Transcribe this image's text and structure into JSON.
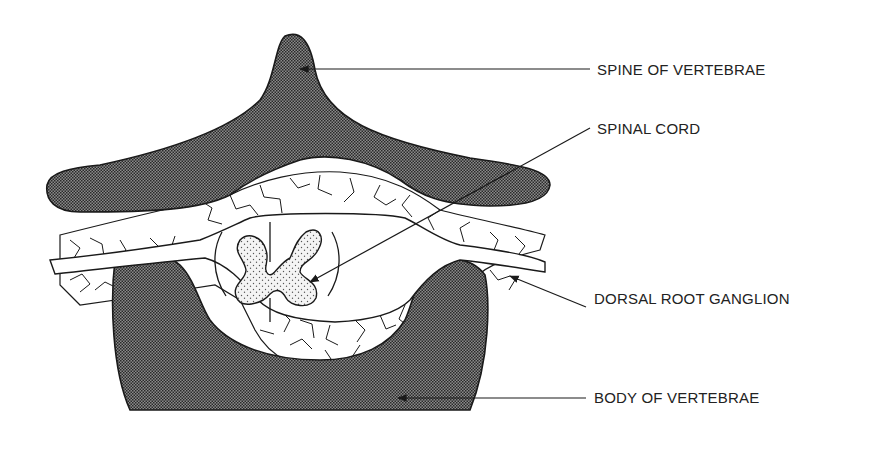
{
  "diagram": {
    "type": "anatomical cross-section",
    "colors": {
      "background": "#ffffff",
      "stroke": "#1a1a1a",
      "bone_fill": "#4a4a4a",
      "text": "#222222"
    },
    "labels": [
      {
        "id": "spine",
        "text": "SPINE OF VERTEBRAE",
        "x": 597,
        "y": 61
      },
      {
        "id": "cord",
        "text": "SPINAL CORD",
        "x": 597,
        "y": 126
      },
      {
        "id": "ganglion",
        "text": "DORSAL ROOT GANGLION",
        "x": 594,
        "y": 290
      },
      {
        "id": "body",
        "text": "BODY OF VERTEBRAE",
        "x": 594,
        "y": 388
      }
    ]
  }
}
